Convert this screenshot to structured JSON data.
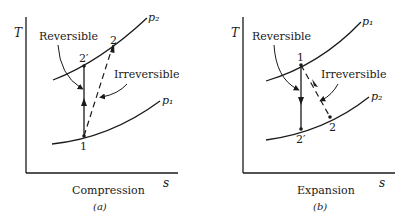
{
  "panels": [
    {
      "id": "a",
      "caption": "Compression",
      "sublabel": "(a)",
      "y_axis": "T",
      "x_axis": "s",
      "curves": [
        {
          "label": "p₂"
        },
        {
          "label": "p₁"
        }
      ],
      "points": {
        "p1": "1",
        "p2": "2",
        "p2prime": "2′"
      },
      "annotations": {
        "reversible": "Reversible",
        "irreversible": "Irreversible"
      }
    },
    {
      "id": "b",
      "caption": "Expansion",
      "sublabel": "(b)",
      "y_axis": "T",
      "x_axis": "s",
      "curves": [
        {
          "label": "p₁"
        },
        {
          "label": "p₂"
        }
      ],
      "points": {
        "p1": "1",
        "p2": "2",
        "p2prime": "2′"
      },
      "annotations": {
        "reversible": "Reversible",
        "irreversible": "Irreversible"
      }
    }
  ],
  "colors": {
    "ink": "#1a1a1a",
    "background": "#ffffff"
  }
}
